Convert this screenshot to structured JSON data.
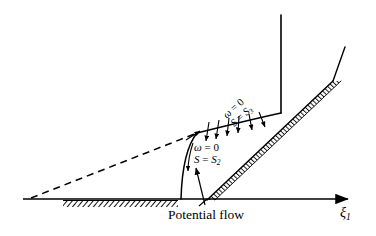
{
  "figure": {
    "width": 376,
    "height": 236,
    "background_color": "#ffffff",
    "stroke_color": "#000000"
  },
  "axis": {
    "horizontal_label": "ξ",
    "horizontal_label_subscript": "1",
    "arrow": "right-arrowhead"
  },
  "labels": {
    "potential_flow": "Potential flow",
    "condition_lower": {
      "vorticity": "ω = 0",
      "entropy_symbol": "S",
      "entropy_equals": " = ",
      "entropy_value": "S",
      "entropy_subscript": "2",
      "vorticity_symbol": "ω",
      "vorticity_equals": " = ",
      "vorticity_value": "0"
    },
    "condition_upper": {
      "vorticity_symbol": "ω",
      "vorticity_equals": " = ",
      "vorticity_value": "0",
      "entropy_symbol": "S",
      "entropy_equals": " = ",
      "entropy_value": "S",
      "entropy_subscript": "3"
    }
  },
  "geometry": {
    "baseline": {
      "x1": 23,
      "y1": 199,
      "x2": 352,
      "y2": 199
    },
    "ground_hatch": {
      "x1": 63,
      "x2": 178,
      "y": 199
    },
    "ramp_hatch": {
      "x1": 207,
      "y1": 200,
      "x2": 333,
      "y2": 81
    },
    "ramp_extension": {
      "x1": 333,
      "y1": 81,
      "x2": 345,
      "y2": 47
    },
    "vertical_line": {
      "x": 281,
      "y1": 15,
      "y2": 113
    },
    "dashed_mach_line": {
      "x1": 31,
      "y1": 198,
      "x2": 197,
      "y2": 133
    },
    "lower_vertical_shock": {
      "x": 181,
      "y1": 199,
      "y2": 150
    },
    "arrow_count_across_shock": 6
  },
  "style": {
    "line_width_main": 1.4,
    "line_width_thin": 1.0,
    "hatch_color": "#111111"
  }
}
